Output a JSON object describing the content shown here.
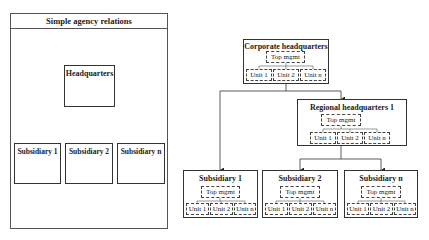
{
  "simple": {
    "title": "Simple agency relations",
    "headquarters": "Headquarters",
    "subsidiaries": [
      "Subsidiary 1",
      "Subsidiary 2",
      "Subsidiary n"
    ]
  },
  "complex": {
    "title": "Complex agency relations",
    "corporate_hq": {
      "title": "Corporate headquarters",
      "top": "Top mgmt",
      "units": [
        "Unit 1",
        "Unit 2",
        "Unit n"
      ]
    },
    "regional_hq": {
      "title": "Regional headquarters 1",
      "top": "Top mgmt",
      "units": [
        "Unit 1",
        "Unit 2",
        "Unit n"
      ]
    },
    "subsidiaries": [
      {
        "title": "Subsidiary 1",
        "top": "Top mgmt",
        "units": [
          "Unit 1",
          "Unit 2",
          "Unit n"
        ]
      },
      {
        "title": "Subsidiary 2",
        "top": "Top mgmt",
        "units": [
          "Unit 1",
          "Unit 2",
          "Unit n"
        ]
      },
      {
        "title": "Subsidiary n",
        "top": "Top mgmt",
        "units": [
          "Unit 1",
          "Unit 2",
          "Unit n"
        ]
      }
    ]
  }
}
